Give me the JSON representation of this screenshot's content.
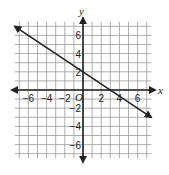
{
  "chart_data": {
    "type": "line",
    "title": "",
    "xlabel": "x",
    "ylabel": "y",
    "origin_label": "O",
    "xlim": [
      -7.5,
      7.5
    ],
    "ylim": [
      -7.5,
      7.5
    ],
    "grid": true,
    "x_ticks": [
      -6,
      -4,
      -2,
      2,
      4,
      6
    ],
    "y_ticks": [
      6,
      4,
      2,
      -2,
      -4,
      -6
    ],
    "x_tick_labels": [
      "−6",
      "−4",
      "−2",
      "2",
      "4",
      "6"
    ],
    "y_tick_labels": [
      "6",
      "4",
      "2",
      "−2",
      "−4",
      "−6"
    ],
    "series": [
      {
        "name": "line",
        "equation": "y = -2/3 x + 2",
        "slope": -0.6667,
        "y_intercept": 2,
        "x_intercept": 3,
        "x": [
          -7.5,
          7.5
        ],
        "y": [
          7,
          -3
        ],
        "color": "#222222",
        "arrows": "both"
      }
    ]
  }
}
